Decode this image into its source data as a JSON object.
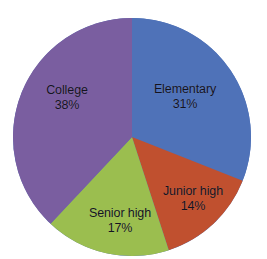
{
  "chart_data": {
    "type": "pie",
    "title": "",
    "subtitle": "",
    "xlabel": "",
    "ylabel": "",
    "legend_position": "none",
    "grid": false,
    "labels_inside_slices": true,
    "start_angle_deg": 0,
    "direction": "clockwise",
    "categories": [
      "Elementary",
      "Junior high",
      "Senior high",
      "College"
    ],
    "values": [
      31,
      14,
      17,
      38
    ],
    "value_unit": "%",
    "value_labels": [
      "31%",
      "14%",
      "17%",
      "38%"
    ],
    "colors": [
      "#4f72b8",
      "#c0502f",
      "#9bbe4f",
      "#7a5ea0"
    ],
    "slices": [
      {
        "name": "Elementary",
        "value": 31,
        "value_label": "31%",
        "color": "#4f72b8",
        "start_deg": 0,
        "end_deg": 111.6,
        "label_x": 185,
        "label_y": 96
      },
      {
        "name": "Junior high",
        "value": 14,
        "value_label": "14%",
        "color": "#c0502f",
        "start_deg": 111.6,
        "end_deg": 162.0,
        "label_x": 193,
        "label_y": 198
      },
      {
        "name": "Senior high",
        "value": 17,
        "value_label": "17%",
        "color": "#9bbe4f",
        "start_deg": 162.0,
        "end_deg": 223.2,
        "label_x": 120,
        "label_y": 220
      },
      {
        "name": "College",
        "value": 38,
        "value_label": "38%",
        "color": "#7a5ea0",
        "start_deg": 223.2,
        "end_deg": 360,
        "label_x": 67,
        "label_y": 97
      }
    ],
    "geometry": {
      "center_x": 132,
      "center_y": 137,
      "radius": 119
    },
    "background_color": "#ffffff",
    "label_text_color": "#14131f"
  }
}
